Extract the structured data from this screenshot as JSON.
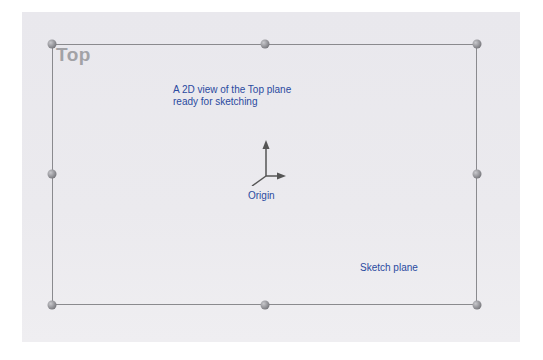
{
  "viewport": {
    "plane_label": "Top",
    "annotations": {
      "description": "A 2D view of the Top plane\nready for sketching",
      "description_line1": "A 2D view of the Top plane",
      "description_line2": "ready for sketching",
      "origin": "Origin",
      "sketch_plane": "Sketch plane"
    },
    "handles": [
      "top-left",
      "top-mid",
      "top-right",
      "left-mid",
      "right-mid",
      "bottom-left",
      "bottom-mid",
      "bottom-right"
    ],
    "colors": {
      "annotation_text": "#2a4aa0",
      "plane_border": "#8a8a8e",
      "plane_label": "#a2a2a6",
      "background": "#ebeaee"
    }
  }
}
